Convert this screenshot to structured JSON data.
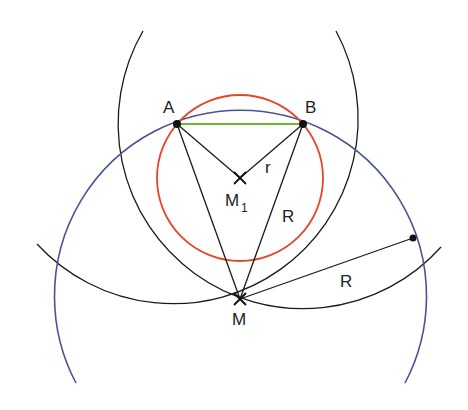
{
  "diagram": {
    "title": "",
    "colors": {
      "black": "#1a1a1a",
      "incircle": "#e8442a",
      "circumcircle": "#4a5492",
      "chord": "#6cb833"
    },
    "points": {
      "A": {
        "label": "A",
        "x": 177,
        "y": 124
      },
      "B": {
        "label": "B",
        "x": 303,
        "y": 124
      },
      "M1": {
        "label": "M",
        "sub": "1",
        "x": 240,
        "y": 178
      },
      "M": {
        "label": "M",
        "x": 240,
        "y": 299
      },
      "P": {
        "label": "",
        "x": 413,
        "y": 238
      }
    },
    "segment_labels": {
      "r": "r",
      "R_chord": "R",
      "R_radius": "R"
    }
  }
}
